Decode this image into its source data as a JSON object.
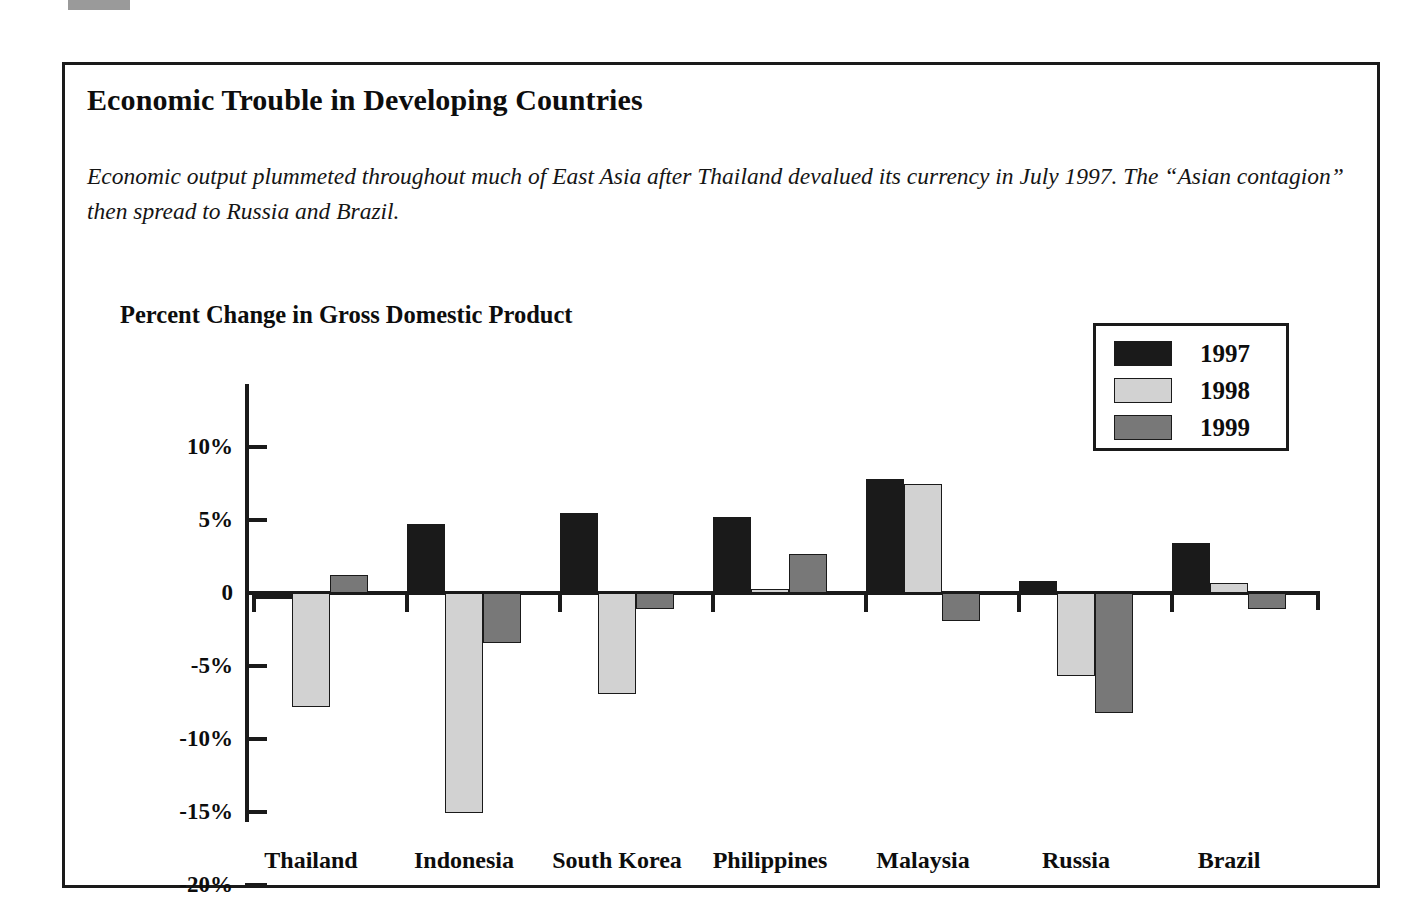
{
  "figure": {
    "title": "Economic Trouble in Developing Countries",
    "subtitle": "Economic output plummeted throughout much of East Asia after Thailand devalued its currency in July 1997. The “Asian contagion” then spread to Russia and Brazil."
  },
  "legend": {
    "position": "top-right",
    "entries": [
      {
        "label": "1997",
        "color": "#1a1a1a"
      },
      {
        "label": "1998",
        "color": "#d2d2d2"
      },
      {
        "label": "1999",
        "color": "#787878"
      }
    ]
  },
  "axis": {
    "tick_labels": [
      "10%",
      "5%",
      "0",
      "-5%",
      "-10%",
      "-15%",
      "-20%"
    ],
    "tick_values": [
      10,
      5,
      0,
      -5,
      -10,
      -15,
      -20
    ]
  },
  "chart_data": {
    "type": "bar",
    "title": "Percent Change in Gross Domestic Product",
    "xlabel": "",
    "ylabel": "",
    "ylim": [
      -20,
      10
    ],
    "grid": false,
    "legend_position": "top-right",
    "categories": [
      "Thailand",
      "Indonesia",
      "South Korea",
      "Philippines",
      "Malaysia",
      "Russia",
      "Brazil"
    ],
    "series": [
      {
        "name": "1997",
        "color": "#1a1a1a",
        "values": [
          -0.4,
          4.7,
          5.5,
          5.2,
          7.8,
          0.8,
          3.4
        ]
      },
      {
        "name": "1998",
        "color": "#d2d2d2",
        "values": [
          -7.8,
          -15.1,
          -6.9,
          0.3,
          7.5,
          -5.7,
          0.7
        ]
      },
      {
        "name": "1999",
        "color": "#787878",
        "values": [
          1.2,
          -3.4,
          -1.1,
          2.7,
          -1.9,
          -8.2,
          -1.1
        ]
      }
    ]
  }
}
